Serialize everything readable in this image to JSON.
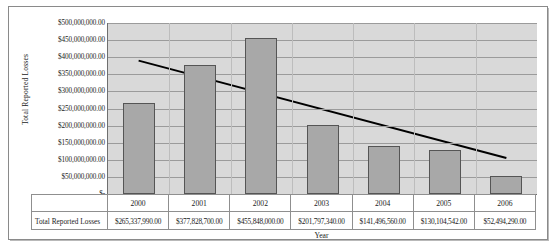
{
  "chart_data": {
    "type": "bar",
    "title": "",
    "xlabel": "Year",
    "ylabel": "Total Reported Losses",
    "categories": [
      "2000",
      "2001",
      "2002",
      "2003",
      "2004",
      "2005",
      "2006"
    ],
    "series": [
      {
        "name": "Total Reported Losses",
        "values": [
          265337990.0,
          377828700.0,
          455848000.0,
          201797340.0,
          141496560.0,
          130104542.0,
          52494290.0
        ]
      }
    ],
    "value_labels": [
      "$265,337,990.00",
      "$377,828,700.00",
      "$455,848,000.00",
      "$201,797,340.00",
      "$141,496,560.00",
      "$130,104,542.00",
      "$52,494,290.00"
    ],
    "ylim": [
      0,
      500000000
    ],
    "ytick_values": [
      0,
      50000000,
      100000000,
      150000000,
      200000000,
      250000000,
      300000000,
      350000000,
      400000000,
      450000000,
      500000000
    ],
    "ytick_labels": [
      "$-",
      "$50,000,000.00",
      "$100,000,000.00",
      "$150,000,000.00",
      "$200,000,000.00",
      "$250,000,000.00",
      "$300,000,000.00",
      "$350,000,000.00",
      "$400,000,000.00",
      "$450,000,000.00",
      "$500,000,000.00"
    ],
    "grid": true,
    "legend": "none",
    "trendline": {
      "type": "linear",
      "start_value": 390000000,
      "end_value": 105000000,
      "color": "#000000"
    },
    "colors": {
      "bar_fill": "#a8a8a8",
      "bar_border": "#555555",
      "plot_background": "#d9d9d9",
      "gridline": "#9b9b9b",
      "axis": "#6f6f6f"
    }
  },
  "data_table": {
    "row_header": "Total Reported Losses",
    "category_header": ""
  }
}
